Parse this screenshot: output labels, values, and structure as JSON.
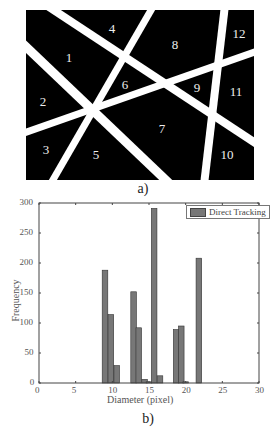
{
  "figure_a": {
    "caption": "a)",
    "regions": [
      {
        "label": "1",
        "x": 43,
        "y": 48
      },
      {
        "label": "2",
        "x": 17,
        "y": 92
      },
      {
        "label": "3",
        "x": 20,
        "y": 140
      },
      {
        "label": "4",
        "x": 86,
        "y": 19
      },
      {
        "label": "5",
        "x": 70,
        "y": 145
      },
      {
        "label": "6",
        "x": 99,
        "y": 75
      },
      {
        "label": "7",
        "x": 136,
        "y": 119
      },
      {
        "label": "8",
        "x": 149,
        "y": 35
      },
      {
        "label": "9",
        "x": 171,
        "y": 78
      },
      {
        "label": "10",
        "x": 201,
        "y": 145
      },
      {
        "label": "11",
        "x": 210,
        "y": 82
      },
      {
        "label": "12",
        "x": 213,
        "y": 24
      }
    ]
  },
  "figure_b": {
    "caption": "b)"
  },
  "chart_data": {
    "type": "bar",
    "title": "",
    "xlabel": "Diameter (pixel)",
    "ylabel": "Frequency",
    "xlim": [
      0,
      30
    ],
    "ylim": [
      0,
      300
    ],
    "xticks": [
      0,
      5,
      10,
      15,
      20,
      25,
      30
    ],
    "yticks": [
      0,
      50,
      100,
      150,
      200,
      250,
      300
    ],
    "legend": {
      "position": "top-right",
      "entries": [
        "Direct Tracking"
      ]
    },
    "grid": false,
    "bar_color": "#777777",
    "series": [
      {
        "name": "Direct Tracking",
        "x": [
          9.0,
          9.8,
          10.6,
          12.9,
          13.6,
          14.4,
          15.0,
          15.7,
          16.5,
          18.7,
          19.4,
          20.0,
          21.8
        ],
        "values": [
          188,
          114,
          29,
          152,
          92,
          6,
          2,
          291,
          12,
          89,
          95,
          2,
          208
        ]
      }
    ]
  }
}
